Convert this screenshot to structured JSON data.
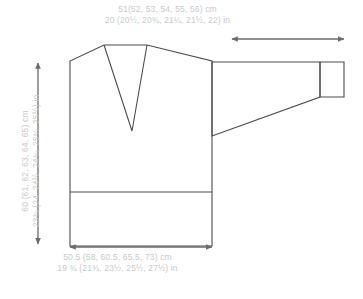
{
  "diagram": {
    "line_color": "#4d4d4d",
    "text_color": "#c9c9c9",
    "arrow_color": "#6b6b6b",
    "background": "#ffffff"
  },
  "measurements": {
    "sleeve_width": {
      "cm": "51(52, 53, 54, 55, 56) cm",
      "in": "20 (20½, 20¾, 21¼, 21½, 22) in"
    },
    "body_length": {
      "cm": "60 (61, 62, 63, 64, 65) cm",
      "in": "23¾ (24, 24½, 24¾, 25¼, 25½) in"
    },
    "body_width": {
      "cm": "50.5 (58, 60.5, 65.5, 73) cm",
      "in": "19 ¾ (21¾, 23½, 25½, 27½) in"
    }
  },
  "shapes": {
    "body_outline": "M 70,61 L 70,246 L 212,246 L 212,61 L 147,45 L 104,45 Z",
    "neckline": "M 147,45 L 132,131 L 104,45",
    "hem_line": "M 70,192 L 212,192",
    "sleeve_outline": "M 212,62 L 320,62 L 320,97 L 212,136 Z",
    "cuff_outline": "M 320,62 L 344,62 L 344,97 L 320,97 Z",
    "shoulder_left": "M 70,61 L 104,45",
    "shoulder_right": "M 147,45 L 212,61"
  },
  "arrows": {
    "vertical_length": {
      "x": 38,
      "y1": 63,
      "y2": 244
    },
    "sleeve_horizontal": {
      "y": 39,
      "x1": 232,
      "x2": 344
    },
    "body_horizontal": {
      "y": 247,
      "x1": 70,
      "x2": 212
    }
  }
}
